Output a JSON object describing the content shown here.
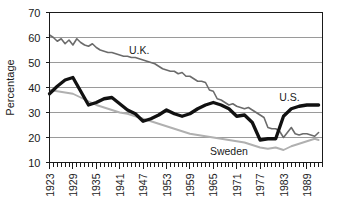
{
  "chart_data": {
    "type": "line",
    "title": "",
    "xlabel": "",
    "ylabel": "Percentage",
    "ylim": [
      10,
      70
    ],
    "ytick_labels": [
      "70",
      "60",
      "50",
      "40",
      "30",
      "20",
      "10"
    ],
    "ytick_values": [
      70,
      60,
      50,
      40,
      30,
      20,
      10
    ],
    "xlim": [
      1923,
      1993
    ],
    "xtick_labels": [
      "1923",
      "1929",
      "1935",
      "1941",
      "1947",
      "1953",
      "1959",
      "1965",
      "1971",
      "1977",
      "1983",
      "1989"
    ],
    "xtick_values": [
      1923,
      1929,
      1935,
      1941,
      1947,
      1953,
      1959,
      1965,
      1971,
      1977,
      1983,
      1989
    ],
    "grid": true,
    "legend_position": "inline-annotations",
    "annotations": [
      {
        "text": "U.K.",
        "x": 1946,
        "y": 53.5
      },
      {
        "text": "U.S.",
        "x": 1984.5,
        "y": 34.5
      },
      {
        "text": "Sweden",
        "x": 1969,
        "y": 13.2
      }
    ],
    "series": [
      {
        "name": "U.K.",
        "color": "#6b6b6b",
        "stroke_width": 1.6,
        "x": [
          1923,
          1924,
          1925,
          1926,
          1927,
          1928,
          1929,
          1930,
          1931,
          1932,
          1933,
          1934,
          1935,
          1936,
          1937,
          1938,
          1939,
          1940,
          1941,
          1942,
          1943,
          1944,
          1945,
          1946,
          1947,
          1948,
          1949,
          1950,
          1951,
          1952,
          1953,
          1954,
          1955,
          1956,
          1957,
          1958,
          1959,
          1960,
          1961,
          1962,
          1963,
          1964,
          1965,
          1966,
          1967,
          1968,
          1969,
          1970,
          1971,
          1972,
          1973,
          1974,
          1975,
          1976,
          1977,
          1978,
          1979,
          1980,
          1981,
          1982,
          1983,
          1984,
          1985,
          1986,
          1987,
          1988,
          1989,
          1990,
          1991,
          1992
        ],
        "values": [
          61.0,
          60.0,
          58.5,
          59.5,
          57.5,
          59.0,
          57.0,
          59.5,
          58.0,
          57.0,
          56.5,
          57.5,
          56.0,
          55.0,
          54.5,
          54.0,
          54.0,
          53.5,
          53.0,
          52.5,
          52.5,
          52.0,
          52.0,
          51.5,
          51.0,
          50.5,
          50.0,
          49.5,
          48.5,
          47.5,
          47.0,
          46.5,
          46.5,
          45.5,
          46.0,
          44.5,
          44.5,
          43.5,
          42.5,
          42.5,
          42.0,
          39.0,
          38.5,
          35.5,
          35.0,
          34.0,
          33.0,
          33.5,
          32.5,
          32.0,
          31.5,
          32.0,
          31.0,
          30.0,
          29.0,
          28.0,
          24.0,
          23.5,
          23.5,
          22.5,
          20.0,
          22.0,
          24.0,
          21.5,
          21.0,
          21.5,
          21.5,
          21.0,
          20.5,
          22.0
        ]
      },
      {
        "name": "Sweden",
        "color": "#b0b0b0",
        "stroke_width": 1.9,
        "x": [
          1923,
          1925,
          1927,
          1929,
          1931,
          1933,
          1935,
          1937,
          1939,
          1941,
          1943,
          1945,
          1947,
          1949,
          1951,
          1953,
          1955,
          1957,
          1959,
          1961,
          1963,
          1965,
          1967,
          1969,
          1971,
          1973,
          1975,
          1977,
          1979,
          1981,
          1983,
          1985,
          1987,
          1989,
          1991,
          1992
        ],
        "values": [
          39.0,
          38.5,
          38.0,
          37.5,
          36.0,
          34.5,
          33.0,
          32.0,
          31.0,
          30.0,
          29.5,
          28.5,
          27.5,
          26.5,
          25.5,
          24.5,
          23.5,
          22.5,
          21.5,
          21.0,
          20.5,
          20.0,
          19.5,
          19.0,
          18.5,
          18.0,
          17.0,
          16.0,
          15.5,
          16.0,
          15.0,
          16.5,
          17.5,
          18.5,
          19.5,
          19.0
        ]
      },
      {
        "name": "U.S.",
        "color": "#111111",
        "stroke_width": 3.3,
        "x": [
          1923,
          1925,
          1927,
          1929,
          1931,
          1933,
          1935,
          1937,
          1939,
          1941,
          1943,
          1945,
          1947,
          1949,
          1951,
          1953,
          1955,
          1957,
          1959,
          1961,
          1963,
          1965,
          1967,
          1969,
          1971,
          1973,
          1975,
          1977,
          1979,
          1981,
          1983,
          1985,
          1987,
          1989,
          1991,
          1992
        ],
        "values": [
          37.5,
          40.5,
          43.0,
          44.0,
          38.5,
          33.0,
          34.0,
          35.5,
          36.0,
          33.5,
          31.0,
          29.5,
          26.5,
          27.5,
          29.0,
          31.0,
          29.5,
          28.5,
          29.5,
          31.5,
          33.0,
          34.0,
          33.0,
          31.5,
          28.5,
          29.0,
          26.0,
          19.0,
          19.5,
          19.5,
          28.5,
          31.5,
          32.5,
          33.0,
          33.0,
          33.0
        ]
      }
    ]
  }
}
